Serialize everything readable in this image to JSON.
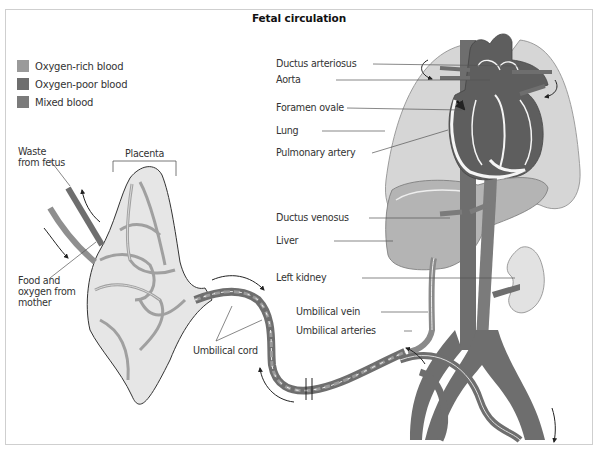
{
  "title": "Fetal circulation",
  "colors": {
    "oxygen_rich": "#9a9a9a",
    "oxygen_poor": "#6e6e6e",
    "mixed": "#7f7f7f",
    "lung": "#d6d6d6",
    "liver": "#b4b4b4",
    "kidney": "#e2e2e2",
    "frame_border": "#cfcfcf"
  },
  "legend": [
    {
      "label": "Oxygen-rich blood",
      "color": "#9a9a9a"
    },
    {
      "label": "Oxygen-poor blood",
      "color": "#6e6e6e"
    },
    {
      "label": "Mixed blood",
      "color": "#7b7b7b"
    }
  ],
  "labels": {
    "waste_from_fetus": "Waste from fetus",
    "placenta": "Placenta",
    "food_and_oxygen": "Food and oxygen from mother",
    "umbilical_cord": "Umbilical cord",
    "ductus_arteriosus": "Ductus arteriosus",
    "aorta": "Aorta",
    "foramen_ovale": "Foramen ovale",
    "lung": "Lung",
    "pulmonary_artery": "Pulmonary artery",
    "ductus_venosus": "Ductus venosus",
    "liver": "Liver",
    "left_kidney": "Left kidney",
    "umbilical_vein": "Umbilical vein",
    "umbilical_arteries": "Umbilical arteries"
  }
}
